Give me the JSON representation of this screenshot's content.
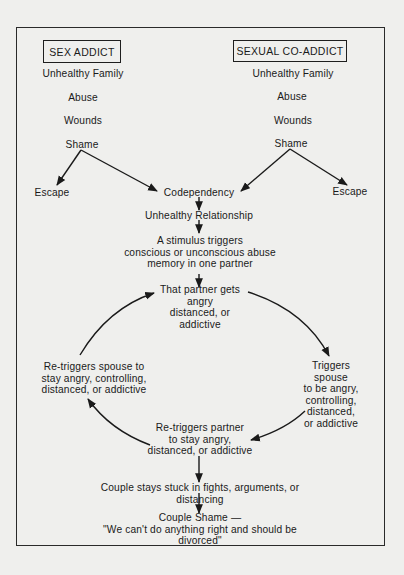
{
  "left_column": {
    "header": "SEX ADDICT",
    "steps": [
      "Unhealthy Family",
      "Abuse",
      "Wounds",
      "Shame"
    ],
    "escape": "Escape"
  },
  "right_column": {
    "header": "SEXUAL CO-ADDICT",
    "steps": [
      "Unhealthy Family",
      "Abuse",
      "Wounds",
      "Shame"
    ],
    "escape": "Escape"
  },
  "center": {
    "codependency": "Codependency",
    "unhealthy_relationship": "Unhealthy Relationship",
    "stimulus": "A stimulus triggers\nconscious or unconscious abuse\nmemory in one partner"
  },
  "cycle": {
    "top": "That partner gets\nangry\ndistanced, or\naddictive",
    "right": "Triggers spouse\nto be angry,\ncontrolling, distanced,\nor addictive",
    "bottom": "Re-triggers partner\nto stay angry,\ndistanced, or addictive",
    "left": "Re-triggers spouse to\nstay angry, controlling,\ndistanced, or addictive"
  },
  "outcome": {
    "stuck": "Couple stays stuck in fights, arguments, or distancing",
    "shame": "Couple Shame —\n\"We can't do anything right and should be divorced\""
  },
  "colors": {
    "background": "#efefed",
    "ink": "#1a1a1a"
  }
}
